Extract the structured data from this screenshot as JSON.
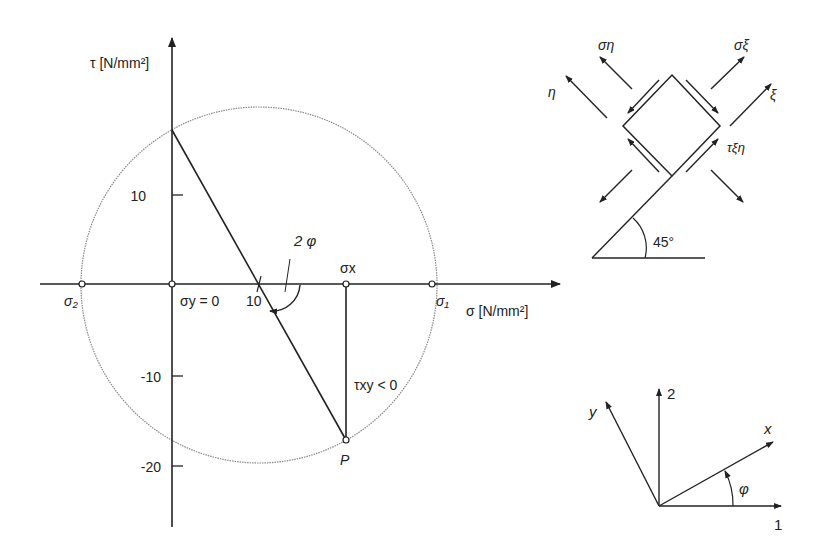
{
  "mohr": {
    "tau_axis_label": "τ [N/mm²]",
    "sigma_axis_label": "σ [N/mm²]",
    "tau_ticks": [
      {
        "label": "10",
        "value": 10
      },
      {
        "label": "-10",
        "value": -10
      },
      {
        "label": "-20",
        "value": -20
      }
    ],
    "sigma_tick": {
      "label": "10",
      "value": 10
    },
    "sigma2_label": "σ₂",
    "sigma1_label": "σ₁",
    "sigma_y_label": "σy = 0",
    "sigma_x_label": "σx",
    "angle_label": "2 φ",
    "tau_xy_label": "τxy < 0",
    "point_label": "P"
  },
  "element": {
    "sigma_eta_label": "ση",
    "sigma_xi_label": "σξ",
    "eta_label": "η",
    "xi_label": "ξ",
    "tau_label": "τξη",
    "angle_label": "45°"
  },
  "axes": {
    "y_label": "y",
    "axis2_label": "2",
    "x_label": "x",
    "phi_label": "φ",
    "axis1_label": "1"
  }
}
